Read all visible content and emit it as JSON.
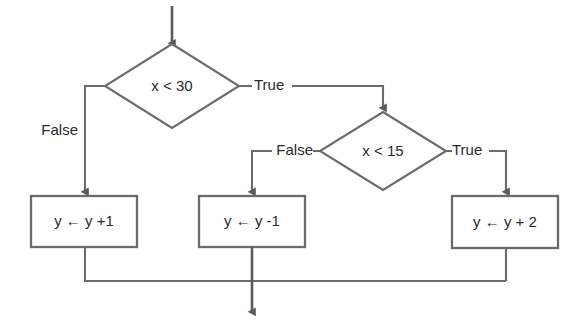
{
  "diagram": {
    "colors": {
      "stroke": "#6b6b6b",
      "stroke_dark": "#5a5a5a",
      "text": "#2b2b2b",
      "background": "#ffffff",
      "arrowhead": "#5a5a5a"
    },
    "decisions": [
      {
        "id": "decision-x-lt-30",
        "label": "x < 30",
        "cx": 172,
        "cy": 86,
        "rx": 67,
        "ry": 42
      },
      {
        "id": "decision-x-lt-15",
        "label": "x < 15",
        "cx": 383,
        "cy": 151,
        "rx": 63,
        "ry": 39
      }
    ],
    "processes": [
      {
        "id": "process-y-plus-1",
        "label": "y ← y +1",
        "x": 31,
        "y": 196,
        "w": 106,
        "h": 51
      },
      {
        "id": "process-y-minus-1",
        "label": "y ← y -1",
        "x": 199,
        "y": 196,
        "w": 106,
        "h": 51
      },
      {
        "id": "process-y-plus-2",
        "label": "y ← y + 2",
        "x": 452,
        "y": 196,
        "w": 106,
        "h": 52
      }
    ],
    "edge_labels": [
      {
        "id": "label-false-outer",
        "text": "False",
        "x": 78,
        "y": 131,
        "anchor": "end"
      },
      {
        "id": "label-true-outer",
        "text": "True",
        "x": 254,
        "y": 86,
        "anchor": "start"
      },
      {
        "id": "label-false-inner",
        "text": "False",
        "x": 313,
        "y": 151,
        "anchor": "end"
      },
      {
        "id": "label-true-inner",
        "text": "True",
        "x": 452,
        "y": 151,
        "anchor": "start"
      }
    ],
    "flow_summary": {
      "entry": "top arrow into x < 30",
      "exit": "bottom arrow from merge bar"
    }
  }
}
